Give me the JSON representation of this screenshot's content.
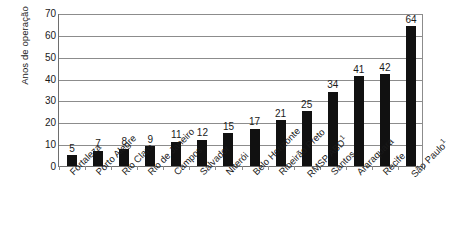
{
  "chart_data": {
    "type": "bar",
    "title": "",
    "subtitle": "",
    "xlabel": "",
    "ylabel": "Anos de operação",
    "ylim": [
      0,
      70
    ],
    "ytick_step": 10,
    "yticks": [
      "70",
      "60",
      "50",
      "40",
      "30",
      "20",
      "10",
      "0"
    ],
    "grid": true,
    "legend": false,
    "legend_position": "none",
    "bar_color": "#111111",
    "gridline_color": "#8c8c8c",
    "axis_color": "#6e6e6e",
    "orientation": "vertical",
    "label_rotation": -45,
    "categories": [
      "Fortaleza",
      "Porto Alegre",
      "Rio Claro",
      "Rio de Janeiro",
      "Campos",
      "Salvador",
      "Niterói",
      "Belo Horizonte",
      "Ribeirão Preto",
      "RMSP ABD",
      "Santos",
      "Araraquara",
      "Recife",
      "São Paulo"
    ],
    "category_superscripts": [
      "",
      "",
      "",
      "",
      "",
      "",
      "",
      "",
      "",
      "1",
      "",
      "",
      "",
      "1"
    ],
    "values": [
      5,
      7,
      8,
      9,
      11,
      12,
      15,
      17,
      21,
      25,
      34,
      41,
      42,
      64
    ],
    "value_labels": [
      "5",
      "7",
      "8",
      "9",
      "11",
      "12",
      "15",
      "17",
      "21",
      "25",
      "34",
      "41",
      "42",
      "64"
    ]
  }
}
